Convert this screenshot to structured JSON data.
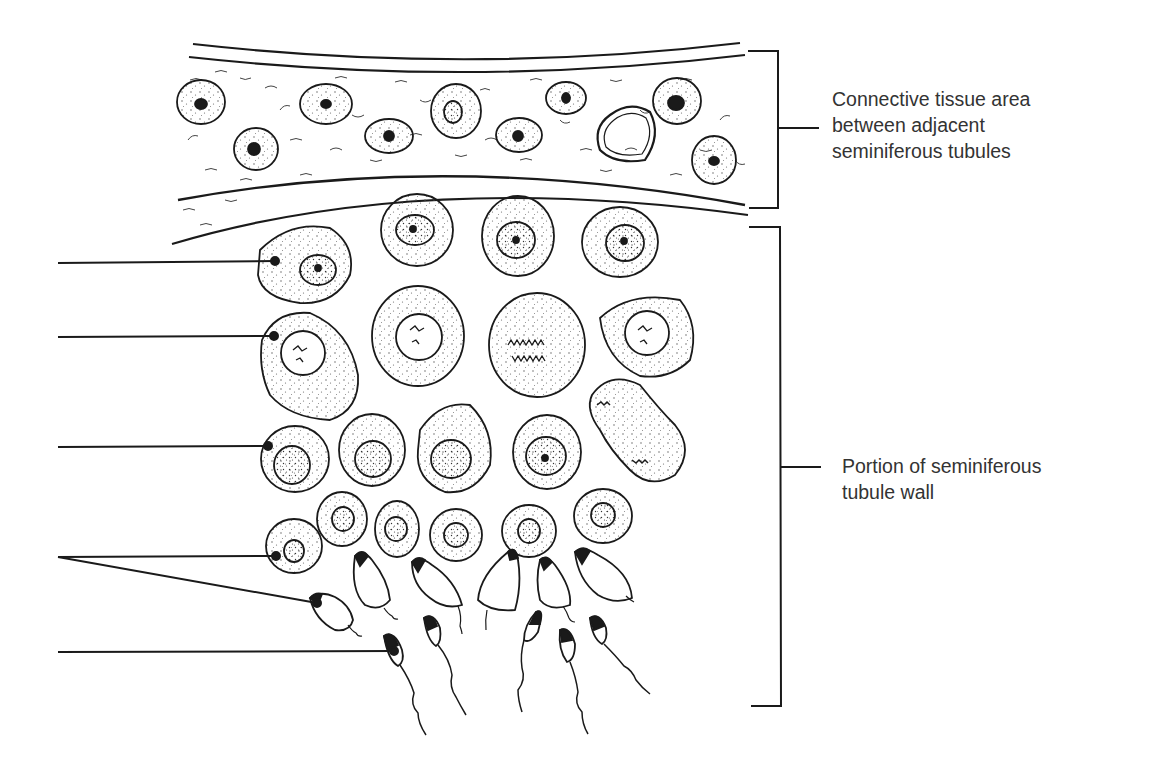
{
  "diagram": {
    "ink_color": "#1a1a1a",
    "text_color": "#333333",
    "background": "#ffffff"
  },
  "labels": {
    "connective_tissue": {
      "lines": [
        "Connective tissue area",
        "between adjacent",
        "seminiferous tubules"
      ]
    },
    "tubule_wall": {
      "lines": [
        "Portion of seminiferous",
        "tubule wall"
      ]
    }
  },
  "brackets": [
    {
      "name": "connective-tissue-bracket",
      "x": 778,
      "top": 50,
      "bottom": 208,
      "tick_y": 128
    },
    {
      "name": "tubule-wall-bracket",
      "x": 780,
      "top": 227,
      "bottom": 706,
      "tick_y": 467
    }
  ],
  "leader_lines": [
    {
      "name": "leader-line-1",
      "from": [
        58,
        263
      ],
      "to": [
        275,
        261
      ],
      "label": ""
    },
    {
      "name": "leader-line-2",
      "from": [
        58,
        337
      ],
      "to": [
        274,
        336
      ],
      "label": ""
    },
    {
      "name": "leader-line-3",
      "from": [
        58,
        447
      ],
      "to": [
        268,
        446
      ],
      "label": ""
    },
    {
      "name": "leader-line-4a",
      "from": [
        58,
        557
      ],
      "to": [
        276,
        556
      ],
      "label": ""
    },
    {
      "name": "leader-line-4b",
      "from": [
        58,
        557
      ],
      "to": [
        317,
        603
      ],
      "label": ""
    },
    {
      "name": "leader-line-5",
      "from": [
        58,
        652
      ],
      "to": [
        394,
        651
      ],
      "label": ""
    }
  ]
}
